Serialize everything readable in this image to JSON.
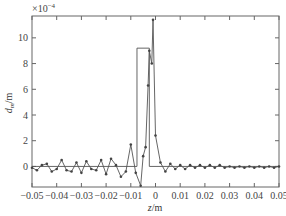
{
  "chart_data": {
    "type": "line",
    "title": "",
    "xlabel": "z/m",
    "ylabel": "d_m/m",
    "y_multiplier": "×10⁻⁴",
    "xlim": [
      -0.05,
      0.05
    ],
    "ylim": [
      -1.6,
      11.7
    ],
    "grid": false,
    "legend": null,
    "x_ticks": [
      -0.05,
      -0.04,
      -0.03,
      -0.02,
      -0.01,
      0,
      0.01,
      0.02,
      0.03,
      0.04,
      0.05
    ],
    "x_tick_labels": [
      "-0.05",
      "-0.04",
      "-0.03",
      "-0.02",
      "-0.01",
      "0",
      "0.01",
      "0.02",
      "0.03",
      "0.04",
      "0.05"
    ],
    "y_ticks": [
      0,
      2,
      4,
      6,
      8,
      10
    ],
    "y_tick_labels": [
      "0",
      "2",
      "4",
      "6",
      "8",
      "10"
    ],
    "series": [
      {
        "name": "reconstructed",
        "style": "line-with-markers",
        "color": "#555555",
        "x": [
          -0.05,
          -0.048,
          -0.046,
          -0.044,
          -0.042,
          -0.04,
          -0.038,
          -0.036,
          -0.034,
          -0.032,
          -0.03,
          -0.028,
          -0.026,
          -0.024,
          -0.022,
          -0.02,
          -0.018,
          -0.016,
          -0.014,
          -0.012,
          -0.01,
          -0.008,
          -0.006,
          -0.005,
          -0.004,
          -0.003,
          -0.0025,
          -0.0015,
          -0.001,
          0.0,
          0.002,
          0.004,
          0.006,
          0.008,
          0.01,
          0.012,
          0.014,
          0.016,
          0.018,
          0.02,
          0.022,
          0.024,
          0.026,
          0.028,
          0.03,
          0.032,
          0.034,
          0.036,
          0.038,
          0.04,
          0.042,
          0.044,
          0.046,
          0.048,
          0.05
        ],
        "values": [
          -0.1,
          -0.3,
          0.1,
          0.2,
          -0.4,
          -0.2,
          0.5,
          -0.3,
          -0.4,
          0.3,
          -0.5,
          0.4,
          -0.2,
          -0.3,
          0.5,
          -0.6,
          0.6,
          0.1,
          -0.8,
          -0.4,
          1.7,
          -0.5,
          -1.5,
          0.8,
          1.5,
          6.3,
          9.0,
          8.0,
          11.4,
          2.4,
          0.3,
          -0.4,
          0.2,
          -0.2,
          0.1,
          -0.2,
          0.1,
          -0.1,
          0.1,
          -0.1,
          0.1,
          -0.1,
          0.1,
          -0.1,
          0.0,
          -0.1,
          0.0,
          -0.1,
          0.0,
          -0.1,
          0.0,
          -0.1,
          0.0,
          -0.1,
          0.0
        ]
      },
      {
        "name": "true profile",
        "style": "step",
        "color": "#555555",
        "x": [
          -0.05,
          -0.0075,
          -0.0075,
          -0.0025,
          -0.0025,
          0.05
        ],
        "values": [
          0,
          0,
          9.2,
          9.2,
          0,
          0
        ]
      }
    ]
  }
}
